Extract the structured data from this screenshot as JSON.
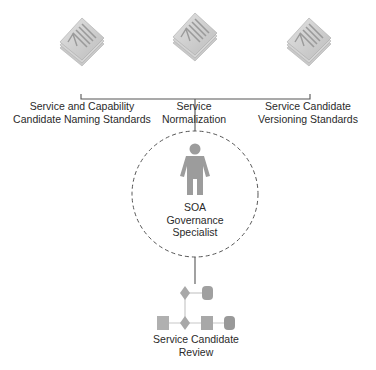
{
  "diagram": {
    "standards": [
      {
        "id": "naming",
        "icon": "document-stack-icon",
        "lines": [
          "Service and Capability",
          "Candidate Naming Standards"
        ],
        "cx": 82
      },
      {
        "id": "normalization",
        "icon": "document-stack-icon",
        "lines": [
          "Service",
          "Normalization"
        ],
        "cx": 194
      },
      {
        "id": "versioning",
        "icon": "document-stack-icon",
        "lines": [
          "Service Candidate",
          "Versioning Standards"
        ],
        "cx": 308
      }
    ],
    "role": {
      "icon": "person-icon",
      "lines": [
        "SOA",
        "Governance",
        "Specialist"
      ]
    },
    "process": {
      "icon": "workflow-icon",
      "lines": [
        "Service Candidate",
        "Review"
      ]
    },
    "colors": {
      "line": "#555555",
      "shape": "#a8a8a8",
      "shape_dark": "#8f8f8f",
      "dash": "#555555",
      "text": "#2a2a2a"
    }
  }
}
